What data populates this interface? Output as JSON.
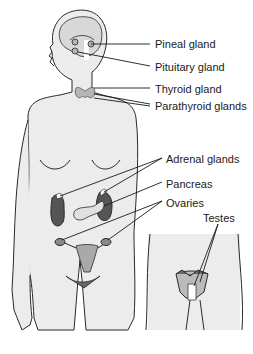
{
  "diagram": {
    "colors": {
      "body_fill": "#ececec",
      "outline": "#2a2a2a",
      "gland_fill": "#a9a9a9",
      "kidney_fill": "#555555",
      "background": "#ffffff"
    },
    "labels": [
      {
        "id": "pineal",
        "text": "Pineal gland",
        "x": 155,
        "y": 38
      },
      {
        "id": "pituitary",
        "text": "Pituitary gland",
        "x": 155,
        "y": 61
      },
      {
        "id": "thyroid",
        "text": "Thyroid gland",
        "x": 155,
        "y": 83
      },
      {
        "id": "parathyroid",
        "text": "Parathyroid glands",
        "x": 155,
        "y": 100
      },
      {
        "id": "adrenal",
        "text": "Adrenal glands",
        "x": 166,
        "y": 153
      },
      {
        "id": "pancreas",
        "text": "Pancreas",
        "x": 166,
        "y": 178
      },
      {
        "id": "ovaries",
        "text": "Ovaries",
        "x": 166,
        "y": 197
      },
      {
        "id": "testes",
        "text": "Testes",
        "x": 203,
        "y": 212
      }
    ]
  }
}
